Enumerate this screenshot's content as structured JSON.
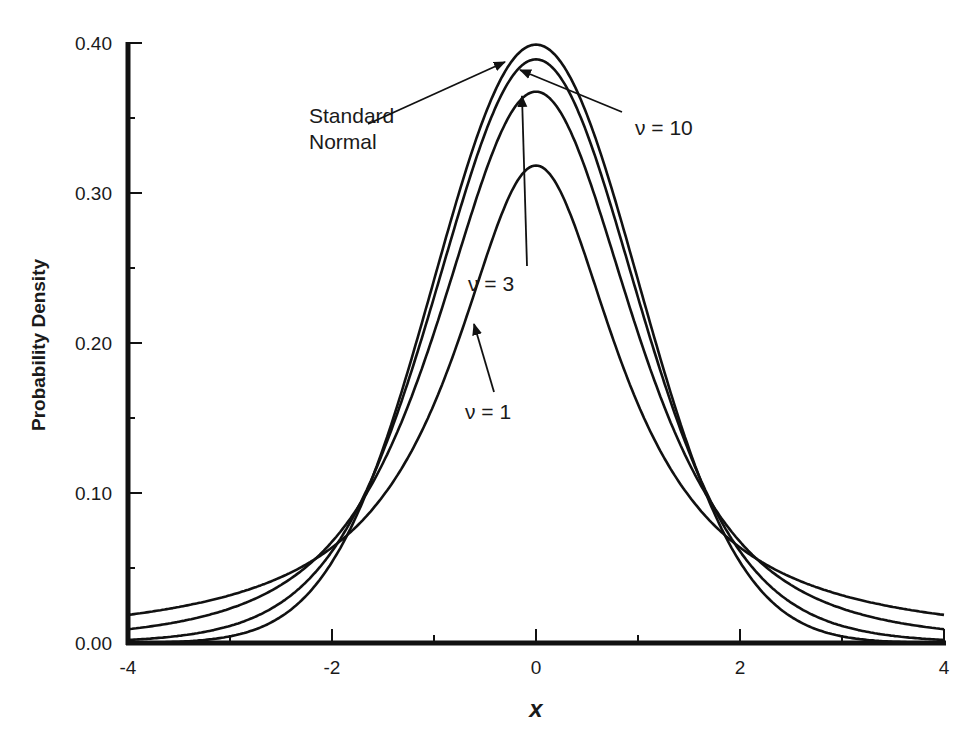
{
  "chart_data": {
    "type": "line",
    "title": "",
    "xlabel": "x",
    "ylabel": "Probability Density",
    "xlim": [
      -4,
      4
    ],
    "ylim": [
      0,
      0.4
    ],
    "grid": false,
    "legend": "none (inline annotations with arrows)",
    "x_ticks": [
      -4,
      -2,
      0,
      2,
      4
    ],
    "x_tick_labels": [
      "-4",
      "-2",
      "0",
      "2",
      "4"
    ],
    "x_minor_ticks": [
      -3,
      -1,
      1,
      3
    ],
    "y_ticks": [
      0.0,
      0.1,
      0.2,
      0.3,
      0.4
    ],
    "y_tick_labels": [
      "0.00",
      "0.10",
      "0.20",
      "0.30",
      "0.40"
    ],
    "y_minor_ticks": [
      0.05,
      0.15,
      0.25,
      0.35
    ],
    "x": [
      -4,
      -3.5,
      -3,
      -2.5,
      -2,
      -1.5,
      -1,
      -0.5,
      0,
      0.5,
      1,
      1.5,
      2,
      2.5,
      3,
      3.5,
      4
    ],
    "series": [
      {
        "name": "Standard Normal",
        "peak": 0.399,
        "values": [
          0.0001,
          0.0009,
          0.0044,
          0.0175,
          0.054,
          0.1295,
          0.242,
          0.3521,
          0.3989,
          0.3521,
          0.242,
          0.1295,
          0.054,
          0.0175,
          0.0044,
          0.0009,
          0.0001
        ]
      },
      {
        "name": "ν = 10",
        "peak": 0.389,
        "values": [
          0.0028,
          0.0055,
          0.0114,
          0.0269,
          0.0611,
          0.1274,
          0.2304,
          0.3397,
          0.3891,
          0.3397,
          0.2304,
          0.1274,
          0.0611,
          0.0269,
          0.0114,
          0.0055,
          0.0028
        ]
      },
      {
        "name": "ν = 3",
        "peak": 0.368,
        "values": [
          0.0092,
          0.0134,
          0.0229,
          0.0405,
          0.0675,
          0.1245,
          0.2067,
          0.3125,
          0.3676,
          0.3125,
          0.2067,
          0.1245,
          0.0675,
          0.0405,
          0.0229,
          0.0134,
          0.0092
        ]
      },
      {
        "name": "ν = 1",
        "peak": 0.318,
        "values": [
          0.0187,
          0.0241,
          0.0318,
          0.0439,
          0.0637,
          0.0979,
          0.1592,
          0.2546,
          0.3183,
          0.2546,
          0.1592,
          0.0979,
          0.0637,
          0.0439,
          0.0318,
          0.0241,
          0.0187
        ]
      }
    ],
    "annotations": [
      {
        "text": "Standard Normal",
        "points_to": "Standard Normal peak"
      },
      {
        "text": "ν = 10",
        "points_to": "ν = 10 peak"
      },
      {
        "text": "ν = 3",
        "points_to": "ν = 3 peak"
      },
      {
        "text": "ν = 1",
        "points_to": "ν = 1 curve near x≈-0.6"
      }
    ]
  },
  "labels": {
    "ylabel": "Probability Density",
    "xlabel": "x",
    "annot_std_line1": "Standard",
    "annot_std_line2": "Normal",
    "annot_nu10": "ν = 10",
    "annot_nu3": "ν = 3",
    "annot_nu1": "ν = 1"
  },
  "colors": {
    "line": "#111111",
    "background": "#ffffff"
  }
}
